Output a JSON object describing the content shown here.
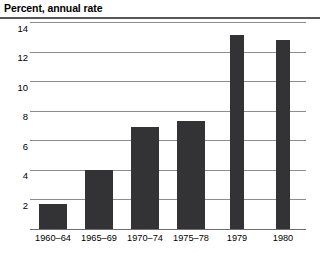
{
  "chart_data": {
    "type": "bar",
    "title": "Percent, annual rate",
    "xlabel": "",
    "ylabel": "Percent, annual rate",
    "categories": [
      "1960–64",
      "1965–69",
      "1970–74",
      "1975–78",
      "1979",
      "1980"
    ],
    "values": [
      1.7,
      4.0,
      6.9,
      7.3,
      13.1,
      12.8
    ],
    "ylim": [
      0,
      14
    ],
    "yticks": [
      2,
      4,
      6,
      8,
      10,
      12,
      14
    ],
    "ytick_labels": [
      "2",
      "4",
      "6",
      "8",
      "10",
      "12",
      "14"
    ],
    "grid": true,
    "legend": "none",
    "bar_color": "#333335",
    "gridline_color": "#8d8d8f",
    "background_color": "#ffffff"
  }
}
